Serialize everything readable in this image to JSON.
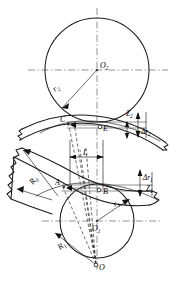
{
  "figure": {
    "kind": "engineering-geometry-diagram",
    "background_color": "#ffffff",
    "line_color": "#1a1a1a"
  },
  "centers": {
    "upper": {
      "label": "O",
      "subscript": "2",
      "x": 97,
      "y": 70,
      "radius": 52
    },
    "lower": {
      "label": "O",
      "subscript": "1",
      "x": 97,
      "y": 221,
      "radius": 37
    },
    "apex": {
      "label": "O",
      "subscript": "",
      "x": 97,
      "y": 266
    }
  },
  "points": [
    {
      "name": "C",
      "label": "C",
      "x": 67,
      "y": 122
    },
    {
      "name": "E",
      "label": "E",
      "x": 100,
      "y": 127
    },
    {
      "name": "A",
      "label": "A",
      "x": 62,
      "y": 186
    },
    {
      "name": "B",
      "label": "B",
      "x": 103,
      "y": 190
    }
  ],
  "radii": [
    {
      "name": "r2",
      "label": "r",
      "subscript": "2",
      "text_x": 55,
      "text_y": 92
    },
    {
      "name": "r1",
      "label": "r",
      "subscript": "1",
      "text_x": 123,
      "text_y": 205
    },
    {
      "name": "R0",
      "label": "R",
      "subscript": "0",
      "text_x": 36,
      "text_y": 183
    },
    {
      "name": "R1",
      "label": "R",
      "subscript": "1",
      "text_x": 63,
      "text_y": 248
    }
  ],
  "dimensions": [
    {
      "name": "Z2",
      "label": "Z",
      "subscript": "2",
      "text_x": 131,
      "text_y": 117
    },
    {
      "name": "dr2",
      "label": "Δr",
      "subscript": "2",
      "text_x": 143,
      "text_y": 132
    },
    {
      "name": "dr1",
      "label": "Δr",
      "subscript": "1",
      "text_x": 145,
      "text_y": 180
    },
    {
      "name": "Z1",
      "label": "Z",
      "subscript": "1",
      "text_x": 148,
      "text_y": 191
    },
    {
      "name": "L",
      "label": "L",
      "subscript": "",
      "text_x": 85,
      "text_y": 160
    }
  ]
}
